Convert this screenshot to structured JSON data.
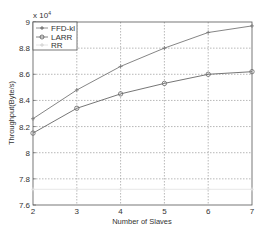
{
  "chart_data": {
    "type": "line",
    "title": "",
    "xlabel": "Number of Slaves",
    "ylabel": "Throughput(Byte/s)",
    "y_multiplier": "x 10^4",
    "x": [
      2,
      3,
      4,
      5,
      6,
      7
    ],
    "xlim": [
      2,
      7
    ],
    "ylim": [
      7.6,
      9.0
    ],
    "xticks": [
      "2",
      "3",
      "4",
      "5",
      "6",
      "7"
    ],
    "yticks": [
      "7.6",
      "7.8",
      "8",
      "8.2",
      "8.4",
      "8.6",
      "8.8",
      "9"
    ],
    "grid": true,
    "legend_position": "upper left",
    "series": [
      {
        "name": "FFD-kl",
        "marker": "+",
        "color": "#777777",
        "values": [
          8.26,
          8.48,
          8.66,
          8.8,
          8.92,
          8.97
        ]
      },
      {
        "name": "LARR",
        "marker": "o",
        "color": "#666666",
        "values": [
          8.15,
          8.34,
          8.45,
          8.53,
          8.6,
          8.62
        ]
      },
      {
        "name": "RR",
        "marker": "+",
        "color": "#e4e4e4",
        "values": [
          7.72,
          7.72,
          7.72,
          7.72,
          7.72,
          7.72
        ]
      }
    ]
  },
  "labels": {
    "xlabel": "Number of Slaves",
    "ylabel": "Throughput(Byte/s)",
    "multiplier_base": "x 10",
    "multiplier_exp": "4"
  },
  "legend": [
    {
      "label": "FFD-kl"
    },
    {
      "label": "LARR"
    },
    {
      "label": "RR"
    }
  ]
}
